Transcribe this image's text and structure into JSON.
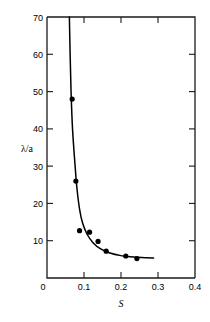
{
  "chart_data": {
    "type": "scatter",
    "title": "",
    "subtitle": "",
    "xlabel": "S",
    "ylabel": "λ/a",
    "xlim": [
      0,
      0.4
    ],
    "ylim": [
      0,
      70
    ],
    "grid": false,
    "legend": null,
    "x_ticks": [
      0,
      0.1,
      0.2,
      0.3,
      0.4
    ],
    "x_tick_labels": [
      "0",
      "0.1",
      "0.2",
      "0.3",
      "0.4"
    ],
    "y_ticks": [
      0,
      10,
      20,
      30,
      40,
      50,
      60,
      70
    ],
    "y_tick_labels": [
      "0",
      "10",
      "20",
      "30",
      "40",
      "50",
      "60",
      "70"
    ],
    "series": [
      {
        "name": "measured points",
        "marker": "filled-circle",
        "color": "#000000",
        "points": [
          {
            "x": 0.068,
            "y": 48.0
          },
          {
            "x": 0.078,
            "y": 26.0
          },
          {
            "x": 0.088,
            "y": 12.7
          },
          {
            "x": 0.115,
            "y": 12.3
          },
          {
            "x": 0.138,
            "y": 9.8
          },
          {
            "x": 0.16,
            "y": 7.2
          },
          {
            "x": 0.213,
            "y": 5.9
          },
          {
            "x": 0.243,
            "y": 5.2
          }
        ]
      },
      {
        "name": "fitted curve",
        "marker": "none",
        "color": "#000000",
        "points": [
          {
            "x": 0.0605,
            "y": 70.0
          },
          {
            "x": 0.0625,
            "y": 60.0
          },
          {
            "x": 0.065,
            "y": 50.0
          },
          {
            "x": 0.069,
            "y": 40.0
          },
          {
            "x": 0.076,
            "y": 30.0
          },
          {
            "x": 0.081,
            "y": 24.0
          },
          {
            "x": 0.088,
            "y": 18.5
          },
          {
            "x": 0.096,
            "y": 14.8
          },
          {
            "x": 0.108,
            "y": 11.8
          },
          {
            "x": 0.125,
            "y": 9.4
          },
          {
            "x": 0.145,
            "y": 7.8
          },
          {
            "x": 0.17,
            "y": 6.7
          },
          {
            "x": 0.2,
            "y": 6.0
          },
          {
            "x": 0.235,
            "y": 5.6
          },
          {
            "x": 0.27,
            "y": 5.4
          },
          {
            "x": 0.288,
            "y": 5.35
          }
        ]
      }
    ]
  },
  "axes": {
    "x_axis_title": "S",
    "y_axis_title": "λ/a"
  },
  "footer": {
    "caption_fragment": ""
  }
}
